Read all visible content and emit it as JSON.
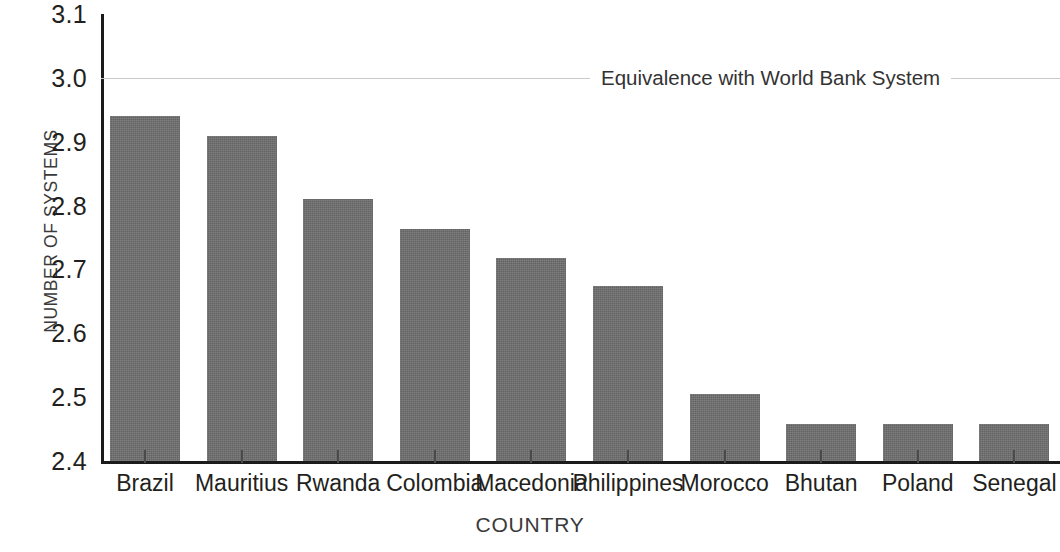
{
  "chart_data": {
    "type": "bar",
    "title": "",
    "xlabel": "COUNTRY",
    "ylabel": "NUMBER OF SYSTEMS",
    "categories": [
      "Brazil",
      "Mauritius",
      "Rwanda",
      "Colombia",
      "Macedonia",
      "Philippines",
      "Morocco",
      "Bhutan",
      "Poland",
      "Senegal"
    ],
    "values": [
      2.945,
      2.913,
      2.815,
      2.768,
      2.722,
      2.678,
      2.51,
      2.463,
      2.463,
      2.463
    ],
    "ylim": [
      2.4,
      3.1
    ],
    "yticks": [
      "2.4",
      "2.5",
      "2.6",
      "2.7",
      "2.8",
      "2.9",
      "3.0",
      "3.1"
    ],
    "ytick_values": [
      2.4,
      2.5,
      2.6,
      2.7,
      2.8,
      2.9,
      3.0,
      3.1
    ],
    "grid": "single-reference-gridline-at-3.0",
    "legend": "none",
    "bar_color": "#6f6f6f",
    "axis_color": "#1b1b1b",
    "gridline_color": "#c9c9c9",
    "annotations": [
      {
        "label": "Equivalence with World Bank System",
        "value": 3.0,
        "kind": "horizontal-reference-line"
      }
    ]
  }
}
